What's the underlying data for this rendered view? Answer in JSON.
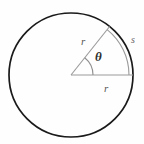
{
  "figure": {
    "background_color": "#fefefe",
    "width": 144,
    "height": 144,
    "geometry": {
      "center_x": 71,
      "center_y": 75,
      "circle_radius": 62,
      "angle_degrees": 51.5,
      "angle_arc_radius": 22,
      "subtended_arc_radius": 58,
      "horizontal_radius_end_x": 133,
      "horizontal_radius_end_y": 75,
      "slanted_radius_end_x": 110,
      "slanted_radius_end_y": 26
    },
    "colors": {
      "circle_stroke": "#1a1a1a",
      "radius_stroke": "#9a9a9a",
      "arc_stroke": "#9a9a9a",
      "angle_arc_stroke": "#8e8e8e",
      "label_text": "#555555",
      "theta_text": "#2e2e2e"
    },
    "labels": {
      "radius_upper": "r",
      "radius_lower": "r",
      "arc_length": "s",
      "central_angle": "θ"
    }
  }
}
